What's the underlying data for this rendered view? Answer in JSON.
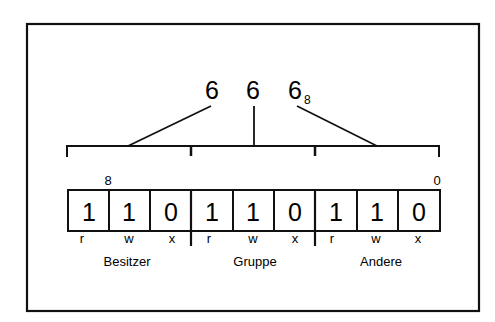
{
  "octal": {
    "digits": [
      "6",
      "6",
      "6"
    ],
    "base_subscript": "8"
  },
  "bit_index": {
    "high": "8",
    "low": "0"
  },
  "bits": [
    "1",
    "1",
    "0",
    "1",
    "1",
    "0",
    "1",
    "1",
    "0"
  ],
  "perm_letters": [
    "r",
    "w",
    "x",
    "r",
    "w",
    "x",
    "r",
    "w",
    "x"
  ],
  "groups": [
    "Besitzer",
    "Gruppe",
    "Andere"
  ],
  "colors": {
    "stroke": "#111111",
    "background": "#ffffff"
  }
}
